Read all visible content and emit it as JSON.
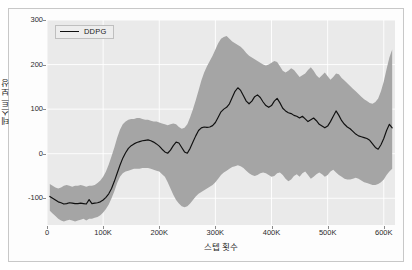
{
  "figure": {
    "background": "#ffffff",
    "frame_color": "#c8c8c8"
  },
  "legend": {
    "entries": [
      "DDPG"
    ],
    "label": "DDPG",
    "position": "upper-left",
    "line_color": "#101010",
    "box_face": "#ededed"
  },
  "axis": {
    "xlabel": "스텝 횟수",
    "ylabel": "테스트 보상",
    "xticks": [
      "0",
      "100K",
      "200K",
      "300K",
      "400K",
      "500K",
      "600K"
    ],
    "yticks": [
      "300",
      "200",
      "100",
      "0",
      "-100"
    ]
  },
  "chart_data": {
    "type": "line",
    "title": "",
    "subtitle": "",
    "xlabel": "스텝 횟수",
    "ylabel": "테스트 보상",
    "xlim": [
      0,
      620000
    ],
    "ylim": [
      -160,
      300
    ],
    "xticks": [
      0,
      100000,
      200000,
      300000,
      400000,
      500000,
      600000
    ],
    "xticklabels": [
      "0",
      "100K",
      "200K",
      "300K",
      "400K",
      "500K",
      "600K"
    ],
    "yticks": [
      -100,
      0,
      100,
      200,
      300
    ],
    "yticklabels": [
      "-100",
      "0",
      "100",
      "200",
      "300"
    ],
    "grid": true,
    "grid_color": "#ffffff",
    "plot_background": "#eaeaea",
    "legend_position": "upper left",
    "band_color": "#a5a5a5",
    "band_label": "standard deviation",
    "line_color": "#101010",
    "series": [
      {
        "name": "DDPG",
        "x": [
          5000,
          10000,
          15000,
          20000,
          25000,
          30000,
          35000,
          40000,
          45000,
          50000,
          55000,
          60000,
          65000,
          70000,
          75000,
          80000,
          85000,
          90000,
          95000,
          100000,
          105000,
          110000,
          115000,
          120000,
          125000,
          130000,
          135000,
          140000,
          145000,
          150000,
          155000,
          160000,
          165000,
          170000,
          175000,
          180000,
          185000,
          190000,
          195000,
          200000,
          205000,
          210000,
          215000,
          220000,
          225000,
          230000,
          235000,
          240000,
          245000,
          250000,
          255000,
          260000,
          265000,
          270000,
          275000,
          280000,
          285000,
          290000,
          295000,
          300000,
          305000,
          310000,
          315000,
          320000,
          325000,
          330000,
          335000,
          340000,
          345000,
          350000,
          355000,
          360000,
          365000,
          370000,
          375000,
          380000,
          385000,
          390000,
          395000,
          400000,
          405000,
          410000,
          415000,
          420000,
          425000,
          430000,
          435000,
          440000,
          445000,
          450000,
          455000,
          460000,
          465000,
          470000,
          475000,
          480000,
          485000,
          490000,
          495000,
          500000,
          505000,
          510000,
          515000,
          520000,
          525000,
          530000,
          535000,
          540000,
          545000,
          550000,
          555000,
          560000,
          565000,
          570000,
          575000,
          580000,
          585000,
          590000,
          595000,
          600000,
          605000,
          610000,
          615000
        ],
        "mean": [
          -96,
          -100,
          -104,
          -108,
          -110,
          -113,
          -112,
          -110,
          -111,
          -112,
          -112,
          -111,
          -112,
          -113,
          -103,
          -112,
          -111,
          -110,
          -108,
          -104,
          -98,
          -90,
          -78,
          -62,
          -44,
          -26,
          -10,
          2,
          12,
          18,
          22,
          25,
          27,
          29,
          30,
          31,
          29,
          26,
          22,
          17,
          10,
          4,
          1,
          8,
          18,
          26,
          24,
          14,
          4,
          1,
          12,
          26,
          40,
          52,
          58,
          60,
          59,
          60,
          63,
          70,
          82,
          94,
          100,
          104,
          112,
          126,
          140,
          148,
          142,
          130,
          118,
          112,
          118,
          128,
          132,
          126,
          116,
          108,
          104,
          108,
          118,
          124,
          114,
          102,
          96,
          92,
          90,
          86,
          84,
          80,
          84,
          78,
          72,
          76,
          80,
          74,
          66,
          62,
          58,
          62,
          72,
          84,
          96,
          86,
          74,
          66,
          60,
          56,
          50,
          44,
          40,
          38,
          36,
          34,
          30,
          22,
          14,
          10,
          20,
          34,
          52,
          66,
          58
        ],
        "lower": [
          -128,
          -134,
          -140,
          -146,
          -150,
          -152,
          -150,
          -148,
          -150,
          -152,
          -150,
          -148,
          -146,
          -150,
          -146,
          -146,
          -144,
          -142,
          -138,
          -132,
          -124,
          -114,
          -100,
          -84,
          -66,
          -52,
          -44,
          -40,
          -38,
          -36,
          -34,
          -34,
          -34,
          -32,
          -32,
          -32,
          -34,
          -36,
          -38,
          -40,
          -46,
          -52,
          -64,
          -78,
          -92,
          -104,
          -112,
          -118,
          -120,
          -118,
          -112,
          -104,
          -96,
          -90,
          -86,
          -82,
          -78,
          -74,
          -70,
          -64,
          -56,
          -48,
          -42,
          -38,
          -34,
          -30,
          -28,
          -26,
          -28,
          -32,
          -38,
          -44,
          -48,
          -50,
          -48,
          -44,
          -42,
          -44,
          -48,
          -52,
          -50,
          -44,
          -42,
          -48,
          -56,
          -62,
          -58,
          -50,
          -46,
          -52,
          -44,
          -40,
          -48,
          -56,
          -52,
          -46,
          -42,
          -46,
          -52,
          -48,
          -40,
          -36,
          -42,
          -48,
          -52,
          -56,
          -58,
          -58,
          -56,
          -54,
          -56,
          -60,
          -64,
          -66,
          -68,
          -70,
          -70,
          -68,
          -64,
          -58,
          -48,
          -40,
          -34
        ],
        "upper": [
          -68,
          -72,
          -76,
          -78,
          -76,
          -72,
          -70,
          -72,
          -74,
          -72,
          -72,
          -70,
          -72,
          -74,
          -72,
          -72,
          -70,
          -66,
          -60,
          -52,
          -40,
          -24,
          -6,
          14,
          36,
          54,
          66,
          72,
          76,
          78,
          78,
          80,
          80,
          78,
          76,
          76,
          74,
          72,
          72,
          70,
          68,
          66,
          64,
          66,
          68,
          66,
          60,
          56,
          58,
          66,
          82,
          100,
          120,
          142,
          164,
          182,
          196,
          208,
          220,
          234,
          248,
          258,
          262,
          264,
          258,
          252,
          248,
          244,
          240,
          234,
          226,
          220,
          216,
          212,
          208,
          204,
          200,
          198,
          200,
          204,
          208,
          206,
          196,
          186,
          182,
          186,
          192,
          188,
          180,
          172,
          176,
          180,
          188,
          194,
          186,
          176,
          170,
          176,
          182,
          174,
          166,
          172,
          180,
          178,
          170,
          164,
          158,
          152,
          146,
          140,
          134,
          128,
          122,
          118,
          114,
          112,
          116,
          124,
          140,
          162,
          190,
          216,
          234
        ]
      }
    ]
  }
}
